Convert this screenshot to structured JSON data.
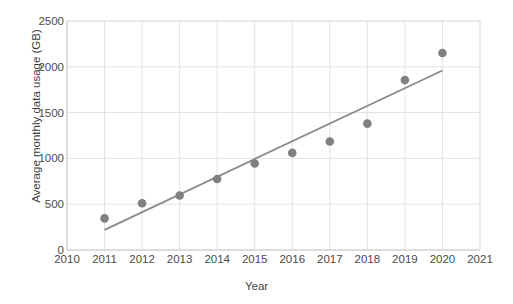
{
  "chart_data": {
    "type": "scatter",
    "title": "",
    "xlabel": "Year",
    "ylabel": "Average monthly data usage (GB)",
    "xlim": [
      2010,
      2021
    ],
    "ylim": [
      0,
      2500
    ],
    "xticks": [
      "2010",
      "2011",
      "2012",
      "2013",
      "2014",
      "2015",
      "2016",
      "2017",
      "2018",
      "2019",
      "2020",
      "2021"
    ],
    "yticks": [
      "0",
      "500",
      "1000",
      "1500",
      "2000",
      "2500"
    ],
    "grid": true,
    "legend": "none",
    "marker_color": "#808080",
    "trendline_color": "#8a8a8a",
    "gridline_color": "#e2e2e2",
    "axis_color": "#d0d0d0",
    "x": [
      2011,
      2012,
      2013,
      2014,
      2015,
      2016,
      2017,
      2018,
      2019,
      2020
    ],
    "values": [
      345,
      510,
      595,
      775,
      945,
      1060,
      1185,
      1380,
      1855,
      2150
    ],
    "series": [
      {
        "name": "Average monthly data usage (GB)",
        "points": [
          {
            "x": 2011,
            "y": 345
          },
          {
            "x": 2012,
            "y": 510
          },
          {
            "x": 2013,
            "y": 595
          },
          {
            "x": 2014,
            "y": 775
          },
          {
            "x": 2015,
            "y": 945
          },
          {
            "x": 2016,
            "y": 1060
          },
          {
            "x": 2017,
            "y": 1185
          },
          {
            "x": 2018,
            "y": 1380
          },
          {
            "x": 2019,
            "y": 1855
          },
          {
            "x": 2020,
            "y": 2150
          }
        ]
      }
    ],
    "trendline": {
      "type": "linear",
      "x_start": 2011,
      "y_start": 220,
      "x_end": 2020,
      "y_end": 1960
    }
  }
}
